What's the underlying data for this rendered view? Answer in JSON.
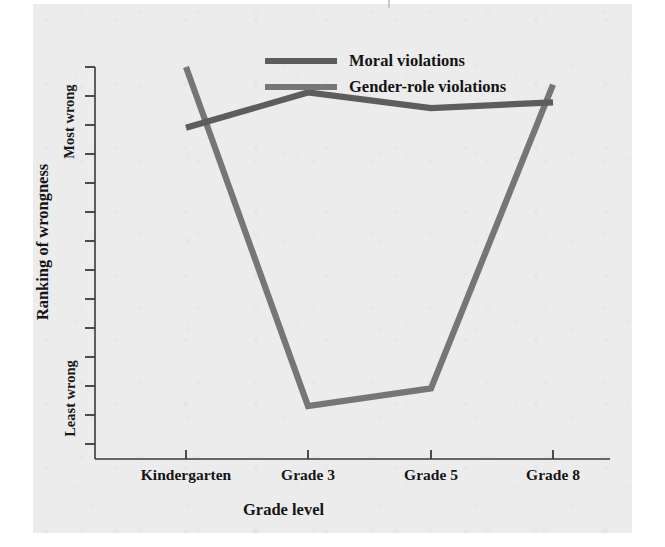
{
  "figure": {
    "panel_background": "#ececed",
    "page_background": "#ffffff"
  },
  "axes": {
    "y_axis_title": "Ranking of wrongness",
    "x_axis_title": "Grade level",
    "y_tick_labels": {
      "top": "Most wrong",
      "bottom": "Least wrong"
    },
    "x_tick_labels": [
      "Kindergarten",
      "Grade 3",
      "Grade 5",
      "Grade 8"
    ]
  },
  "legend": {
    "position": "top-center",
    "entries": [
      {
        "label": "Moral violations",
        "color": "#5d5d5d"
      },
      {
        "label": "Gender-role violations",
        "color": "#767676"
      }
    ]
  },
  "chart_data": {
    "type": "line",
    "title": "",
    "subtitle": "",
    "xlabel": "Grade level",
    "ylabel": "Ranking of wrongness",
    "categories": [
      "Kindergarten",
      "Grade 3",
      "Grade 5",
      "Grade 8"
    ],
    "x": [
      0,
      1,
      2,
      3
    ],
    "ylim": [
      0,
      10
    ],
    "y_axis_ticks_count": 14,
    "y_tick_annotations": [
      {
        "value": 9.4,
        "label": "Most wrong"
      },
      {
        "value": 1.6,
        "label": "Least wrong"
      }
    ],
    "grid": false,
    "series": [
      {
        "name": "Moral violations",
        "color": "#5d5d5d",
        "values": [
          8.45,
          9.35,
          8.95,
          9.1
        ]
      },
      {
        "name": "Gender-role violations",
        "color": "#767676",
        "values": [
          10.0,
          1.35,
          1.8,
          9.55
        ]
      }
    ],
    "annotations": [
      "Gender-role violations decline sharply from Kindergarten to Grade 3, stay low at Grade 5, then rise back to near Kindergarten level by Grade 8.",
      "Moral violations stay consistently high across all grade levels."
    ]
  }
}
